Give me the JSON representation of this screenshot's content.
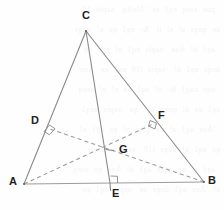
{
  "figure": {
    "width": 224,
    "height": 210,
    "background_color": "#fefefe",
    "solid_stroke_color": "#8a8a8a",
    "dashed_stroke_color": "#9a9a9a",
    "baseline_stroke_color": "#9c9c9c",
    "label_color": "#231f20",
    "points": {
      "A": {
        "x": 24,
        "y": 184
      },
      "B": {
        "x": 204,
        "y": 182
      },
      "C": {
        "x": 86,
        "y": 31
      },
      "D": {
        "x": 47,
        "y": 128
      },
      "E": {
        "x": 110,
        "y": 183
      },
      "F": {
        "x": 153,
        "y": 124
      },
      "G": {
        "x": 110,
        "y": 150
      }
    },
    "labels": [
      {
        "name": "C",
        "text": "C",
        "x": 82,
        "y": 10
      },
      {
        "name": "D",
        "text": "D",
        "x": 31,
        "y": 115
      },
      {
        "name": "F",
        "text": "F",
        "x": 158,
        "y": 110
      },
      {
        "name": "G",
        "text": "G",
        "x": 119,
        "y": 144
      },
      {
        "name": "A",
        "text": "A",
        "x": 9,
        "y": 176
      },
      {
        "name": "B",
        "text": "B",
        "x": 208,
        "y": 175
      },
      {
        "name": "E",
        "text": "E",
        "x": 112,
        "y": 188
      }
    ],
    "solid_segments": [
      {
        "name": "segment-AC",
        "from": "A",
        "to": "C"
      },
      {
        "name": "segment-CB",
        "from": "C",
        "to": "B"
      },
      {
        "name": "segment-AB",
        "from": "A",
        "to": "B"
      },
      {
        "name": "segment-CE",
        "from": "C",
        "to": "E"
      }
    ],
    "dashed_segments": [
      {
        "name": "segment-AF",
        "from": "A",
        "to": "F"
      },
      {
        "name": "segment-BD",
        "from": "B",
        "to": "D"
      }
    ],
    "right_angle_marks": [
      {
        "name": "right-angle-at-D",
        "x": 47,
        "y": 128
      },
      {
        "name": "right-angle-at-F",
        "x": 153,
        "y": 124
      },
      {
        "name": "right-angle-at-E",
        "x": 110,
        "y": 183
      }
    ],
    "tick_marks": [
      {
        "name": "tick-at-G",
        "x": 110,
        "y": 150
      }
    ],
    "extension_below_baseline": {
      "name": "ce-extension",
      "x": 110,
      "y_end": 191
    }
  },
  "ghost_text": {
    "lines": [
      "  pue  aseq  eq1  se  'ÁlaAŋ  ·sapṫs  10",
      "ue  qoŋs  u!  s!  ll  '&-  eq1  ŋo  u!  qoŋs",
      "  aq1  ŭ!  Áue  ·sapṫs  eq1  u!  pue  oŋ",
      "ŭoŋs  aŋ1  ŭ!  ·sapṫs  l10  aŋ1  ue  'Áue",
      "  oqs  uaq1  &-  ŭ!  aq1  ŋo  s!  u!  aseq",
      "aŋ1  ue  ŭ!  qoŋs  aq1  ŋo  ·sapṫs  ueq1",
      "  'Áue  aq1  u!  ue  qoŋs  s!  ŋo  aŋ1  u!",
      "ŋo  aq1  u!  ŭoŋs  l10  ·sapṫs  aq1  ue",
      "  aŋ1  s!  ue  qoŋs  aq1  ŭ!  Áue  ŋo  aseq",
      "u!  'Áue  aq1  ŭoŋs  ue  ·sapṫs  aq1  ŋo"
    ]
  }
}
